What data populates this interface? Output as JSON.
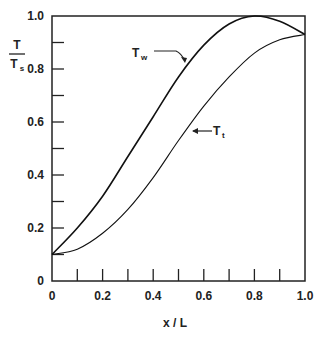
{
  "chart_data": {
    "type": "line",
    "title": "",
    "xlabel": "x / L",
    "ylabel": {
      "numerator": "T",
      "denominator": "T",
      "denominator_sub": "s"
    },
    "xlim": [
      0,
      1.0
    ],
    "ylim": [
      0,
      1.0
    ],
    "grid": false,
    "x_ticks": [
      {
        "value": 0,
        "label": "0"
      },
      {
        "value": 0.2,
        "label": "0.2"
      },
      {
        "value": 0.4,
        "label": "0.4"
      },
      {
        "value": 0.6,
        "label": "0.6"
      },
      {
        "value": 0.8,
        "label": "0.8"
      },
      {
        "value": 1.0,
        "label": "1.0"
      }
    ],
    "x_minor_ticks": [
      0.1,
      0.2,
      0.3,
      0.4,
      0.5,
      0.6,
      0.7,
      0.8,
      0.9
    ],
    "y_ticks": [
      {
        "value": 0,
        "label": "0"
      },
      {
        "value": 0.2,
        "label": "0.2"
      },
      {
        "value": 0.4,
        "label": "0.4"
      },
      {
        "value": 0.6,
        "label": "0.6"
      },
      {
        "value": 0.8,
        "label": "0.8"
      },
      {
        "value": 1.0,
        "label": "1.0"
      }
    ],
    "y_minor_ticks": [
      0.1,
      0.2,
      0.3,
      0.4,
      0.5,
      0.6,
      0.7,
      0.8,
      0.9
    ],
    "x": [
      0,
      0.1,
      0.2,
      0.3,
      0.4,
      0.5,
      0.6,
      0.7,
      0.8,
      0.9,
      1.0
    ],
    "series": [
      {
        "name": "Tw",
        "label_main": "T",
        "label_sub": "w",
        "values": [
          0.1,
          0.2,
          0.32,
          0.47,
          0.62,
          0.77,
          0.89,
          0.97,
          1.0,
          0.98,
          0.93
        ],
        "stroke": "#111111"
      },
      {
        "name": "Tt",
        "label_main": "T",
        "label_sub": "t",
        "values": [
          0.1,
          0.12,
          0.18,
          0.27,
          0.39,
          0.53,
          0.66,
          0.77,
          0.86,
          0.91,
          0.93
        ],
        "stroke": "#111111"
      }
    ],
    "annotations": [
      {
        "series": "Tw",
        "text_main": "T",
        "text_sub": "w",
        "points_to_x": 0.6
      },
      {
        "series": "Tt",
        "text_main": "T",
        "text_sub": "t",
        "points_to_x": 0.55
      }
    ]
  }
}
